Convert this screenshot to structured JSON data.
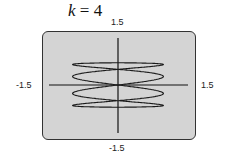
{
  "chart_data": {
    "type": "line",
    "title": "k = 4",
    "parameter": {
      "name": "k",
      "value": 4
    },
    "curve": "parametric x = sin(k t), y = sin(t) style Lissajous curve",
    "xlim": [
      -1.5,
      1.5
    ],
    "ylim": [
      -1.5,
      1.5
    ],
    "tick_labels": {
      "xmin": "-1.5",
      "xmax": "1.5",
      "ymin": "-1.5",
      "ymax": "1.5"
    },
    "grid": false,
    "legend": null
  },
  "labels": {
    "title_var": "k",
    "title_rest": " = 4",
    "ymax": "1.5",
    "ymin": "-1.5",
    "xmin": "-1.5",
    "xmax": "1.5"
  },
  "colors": {
    "screen": "#d4d4d4",
    "curve": "#1a1a1a",
    "border": "#333333"
  }
}
